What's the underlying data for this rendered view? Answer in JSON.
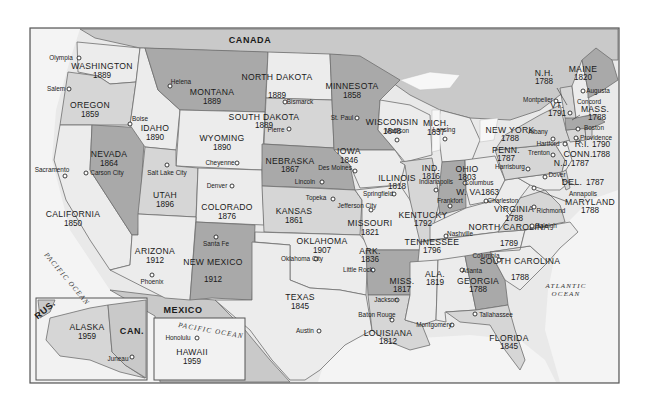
{
  "map": {
    "title": "United States — State Admission Years",
    "regions": {
      "canada": "CANADA",
      "mexico": "MEXICO",
      "russia": "RUS.",
      "canada_inset": "CAN."
    },
    "oceans": {
      "pacific_main": "PACIFIC OCEAN",
      "pacific_hawaii": "PACIFIC OCEAN",
      "atlantic_1": "ATLANTIC",
      "atlantic_2": "OCEAN"
    },
    "states": [
      {
        "name": "WASHINGTON",
        "year": "1889",
        "capital": "Olympia"
      },
      {
        "name": "OREGON",
        "year": "1859",
        "capital": "Salem"
      },
      {
        "name": "CALIFORNIA",
        "year": "1850",
        "capital": "Sacramento"
      },
      {
        "name": "NEVADA",
        "year": "1864",
        "capital": "Carson City"
      },
      {
        "name": "IDAHO",
        "year": "1890",
        "capital": "Boise"
      },
      {
        "name": "MONTANA",
        "year": "1889",
        "capital": "Helena"
      },
      {
        "name": "WYOMING",
        "year": "1890",
        "capital": "Cheyenne"
      },
      {
        "name": "UTAH",
        "year": "1896",
        "capital": "Salt Lake City"
      },
      {
        "name": "ARIZONA",
        "year": "1912",
        "capital": "Phoenix"
      },
      {
        "name": "COLORADO",
        "year": "1876",
        "capital": "Denver"
      },
      {
        "name": "NEW MEXICO",
        "year": "1912",
        "capital": "Santa Fe"
      },
      {
        "name": "NORTH DAKOTA",
        "year": "1889",
        "capital": "Bismarck"
      },
      {
        "name": "SOUTH DAKOTA",
        "year": "1889",
        "capital": "Pierre"
      },
      {
        "name": "NEBRASKA",
        "year": "1867",
        "capital": "Lincoln"
      },
      {
        "name": "KANSAS",
        "year": "1861",
        "capital": "Topeka"
      },
      {
        "name": "OKLAHOMA",
        "year": "1907",
        "capital": "Oklahoma City"
      },
      {
        "name": "TEXAS",
        "year": "1845",
        "capital": "Austin"
      },
      {
        "name": "MINNESOTA",
        "year": "1858",
        "capital": "St. Paul"
      },
      {
        "name": "IOWA",
        "year": "1846",
        "capital": "Des Moines"
      },
      {
        "name": "MISSOURI",
        "year": "1821",
        "capital": "Jefferson City"
      },
      {
        "name": "ARK.",
        "year": "1836",
        "capital": "Little Rock"
      },
      {
        "name": "LOUISIANA",
        "year": "1812",
        "capital": "Baton Rouge"
      },
      {
        "name": "WISCONSIN",
        "year": "1848",
        "capital": "Madison"
      },
      {
        "name": "ILLINOIS",
        "year": "1818",
        "capital": "Springfield"
      },
      {
        "name": "MICH.",
        "year": "1837",
        "capital": "Lansing"
      },
      {
        "name": "IND.",
        "year": "1816",
        "capital": "Indianapolis"
      },
      {
        "name": "OHIO",
        "year": "1803",
        "capital": "Columbus"
      },
      {
        "name": "KENTUCKY",
        "year": "1792",
        "capital": "Frankfort"
      },
      {
        "name": "TENNESSEE",
        "year": "1796",
        "capital": "Nashville"
      },
      {
        "name": "MISS.",
        "year": "1817",
        "capital": "Jackson"
      },
      {
        "name": "ALA.",
        "year": "1819",
        "capital": "Montgomery"
      },
      {
        "name": "GEORGIA",
        "year": "1788",
        "capital": "Atlanta"
      },
      {
        "name": "FLORIDA",
        "year": "1845",
        "capital": "Tallahassee"
      },
      {
        "name": "SOUTH CAROLINA",
        "year": "1788",
        "capital": "Columbia"
      },
      {
        "name": "NORTH CAROLINA",
        "year": "1789",
        "capital": "Raleigh"
      },
      {
        "name": "VIRGINIA",
        "year": "1788",
        "capital": "Richmond"
      },
      {
        "name": "W. VA.",
        "year": "1863",
        "capital": "Charleston"
      },
      {
        "name": "MARYLAND",
        "year": "1788",
        "capital": "Annapolis"
      },
      {
        "name": "DEL.",
        "year": "1787",
        "capital": "Dover"
      },
      {
        "name": "PENN.",
        "year": "1787",
        "capital": "Harrisburg"
      },
      {
        "name": "N.J.",
        "year": "1787",
        "capital": "Trenton"
      },
      {
        "name": "NEW YORK",
        "year": "1788",
        "capital": "Albany"
      },
      {
        "name": "CONN.",
        "year": "1788",
        "capital": "Hartford"
      },
      {
        "name": "R.I.",
        "year": "1790",
        "capital": "Providence"
      },
      {
        "name": "MASS.",
        "year": "1788",
        "capital": "Boston"
      },
      {
        "name": "VT.",
        "year": "1791",
        "capital": "Montpelier"
      },
      {
        "name": "N.H.",
        "year": "1788",
        "capital": "Concord"
      },
      {
        "name": "MAINE",
        "year": "1820",
        "capital": "Augusta"
      },
      {
        "name": "ALASKA",
        "year": "1959",
        "capital": "Juneau"
      },
      {
        "name": "HAWAII",
        "year": "1959",
        "capital": "Honolulu"
      }
    ]
  }
}
